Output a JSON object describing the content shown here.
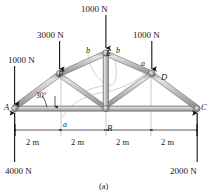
{
  "figure": {
    "caption": "(a)",
    "angle_label": "30°",
    "loads": [
      {
        "name": "load-A",
        "text": "1000 N",
        "x": 8,
        "y": 56
      },
      {
        "name": "load-F",
        "text": "3000 N",
        "x": 37,
        "y": 31
      },
      {
        "name": "load-E",
        "text": "1000 N",
        "x": 81,
        "y": 5
      },
      {
        "name": "load-D",
        "text": "1000 N",
        "x": 133,
        "y": 31
      }
    ],
    "reactions": [
      {
        "name": "reaction-A",
        "text": "4000 N",
        "x": 5,
        "y": 167
      },
      {
        "name": "reaction-C",
        "text": "2000 N",
        "x": 170,
        "y": 167
      }
    ],
    "joints": [
      {
        "name": "joint-A",
        "text": "A",
        "x": 4,
        "y": 103
      },
      {
        "name": "joint-B",
        "text": "B",
        "x": 107,
        "y": 124
      },
      {
        "name": "joint-C",
        "text": "C",
        "x": 201,
        "y": 103
      },
      {
        "name": "joint-D",
        "text": "D",
        "x": 161,
        "y": 73
      },
      {
        "name": "joint-E",
        "text": "E",
        "x": 106,
        "y": 49
      },
      {
        "name": "joint-F",
        "text": "F",
        "x": 58,
        "y": 70
      }
    ],
    "sections": [
      {
        "name": "section-label-b-left",
        "text": "b",
        "x": 86,
        "y": 47
      },
      {
        "name": "section-label-b-right",
        "text": "b",
        "x": 116,
        "y": 47
      },
      {
        "name": "section-label-a-upper",
        "text": "a",
        "x": 141,
        "y": 60
      },
      {
        "name": "section-label-a-lower",
        "text": "a",
        "x": 63,
        "y": 121
      }
    ],
    "dimensions": [
      {
        "name": "dimension-span-1",
        "text": "2 m",
        "x": 26,
        "y": 138
      },
      {
        "name": "dimension-span-2",
        "text": "2 m",
        "x": 71,
        "y": 138
      },
      {
        "name": "dimension-span-3",
        "text": "2 m",
        "x": 116,
        "y": 138
      },
      {
        "name": "dimension-span-4",
        "text": "2 m",
        "x": 161,
        "y": 138
      }
    ],
    "colors": {
      "member_fill": "#b6b6b6",
      "member_edge": "#6e6e6e",
      "member_highlight": "#dcdcdc",
      "arrow": "#141414",
      "text": "#1a1a1a",
      "thin_line": "#8a8a8a",
      "section_curve": "#b9b9b9",
      "background": "#ffffff"
    }
  }
}
